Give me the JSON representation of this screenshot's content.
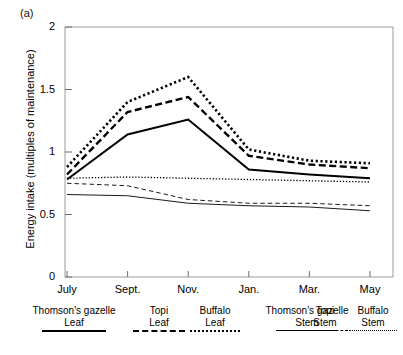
{
  "panel": {
    "label": "(a)"
  },
  "axes": {
    "ylabel": "Energy intake (multiples of maintenance)",
    "yticks": [
      "0",
      "0.5",
      "1",
      "1.5",
      "2"
    ],
    "xticks": [
      "July",
      "Sept.",
      "Nov.",
      "Jan.",
      "Mar.",
      "May"
    ]
  },
  "legend": [
    {
      "name": "Thomson's gazelle",
      "part": "Leaf",
      "style": "solid-thick"
    },
    {
      "name": "Topi",
      "part": "Leaf",
      "style": "dashed-thick"
    },
    {
      "name": "Buffalo",
      "part": "Leaf",
      "style": "dotted-thick"
    },
    {
      "name": "Thomson's gazelle",
      "part": "Stem",
      "style": "solid-thin"
    },
    {
      "name": "Topi",
      "part": "Stem",
      "style": "dashed-thin"
    },
    {
      "name": "Buffalo",
      "part": "Stem",
      "style": "dotted-thin"
    }
  ],
  "chart_data": {
    "type": "line",
    "title": "(a)",
    "xlabel": "",
    "ylabel": "Energy intake (multiples of maintenance)",
    "categories": [
      "July",
      "Sept.",
      "Nov.",
      "Jan.",
      "Mar.",
      "May"
    ],
    "ylim": [
      0,
      2
    ],
    "yticks": [
      0,
      0.5,
      1,
      1.5,
      2
    ],
    "grid": false,
    "legend_position": "below-axis",
    "series": [
      {
        "name": "Thomson's gazelle Leaf",
        "style": "solid-thick",
        "values": [
          0.78,
          1.14,
          1.26,
          0.86,
          0.82,
          0.79
        ]
      },
      {
        "name": "Topi Leaf",
        "style": "dashed-thick",
        "values": [
          0.82,
          1.32,
          1.44,
          0.97,
          0.9,
          0.87
        ]
      },
      {
        "name": "Buffalo Leaf",
        "style": "dotted-thick",
        "values": [
          0.88,
          1.4,
          1.6,
          1.02,
          0.93,
          0.91
        ]
      },
      {
        "name": "Thomson's gazelle Stem",
        "style": "solid-thin",
        "values": [
          0.66,
          0.65,
          0.59,
          0.57,
          0.56,
          0.53
        ]
      },
      {
        "name": "Topi Stem",
        "style": "dashed-thin",
        "values": [
          0.75,
          0.73,
          0.62,
          0.59,
          0.59,
          0.57
        ]
      },
      {
        "name": "Buffalo Stem",
        "style": "dotted-thin",
        "values": [
          0.79,
          0.8,
          0.79,
          0.78,
          0.77,
          0.76
        ]
      }
    ]
  },
  "colors": {
    "ink": "#000000",
    "axis": "#000000",
    "background": "#ffffff"
  }
}
